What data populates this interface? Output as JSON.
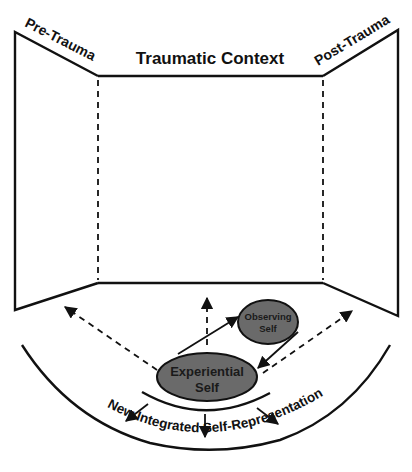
{
  "diagram": {
    "labels": {
      "pre_trauma": "Pre-Trauma",
      "traumatic_context": "Traumatic Context",
      "post_trauma": "Post-Trauma",
      "new_integrated": "New Integrated Self-Representation"
    },
    "nodes": {
      "observing_self": {
        "line1": "Observing",
        "line2": "Self"
      },
      "experiential_self": {
        "line1": "Experiential",
        "line2": "Self"
      }
    },
    "panels": [
      "Pre-Trauma",
      "Traumatic Context",
      "Post-Trauma"
    ],
    "edges": [
      {
        "from": "Experiential Self",
        "to": "Observing Self",
        "style": "solid"
      },
      {
        "from": "Observing Self",
        "to": "Experiential Self",
        "style": "solid"
      },
      {
        "from": "Experiential Self",
        "to": "Pre-Trauma",
        "style": "dashed"
      },
      {
        "from": "Experiential Self",
        "to": "Traumatic Context",
        "style": "dashed"
      },
      {
        "from": "Experiential Self",
        "to": "Post-Trauma",
        "style": "dashed"
      },
      {
        "from": "Experiential Self",
        "to": "New Integrated Self-Representation",
        "style": "solid",
        "count": 3
      }
    ],
    "colors": {
      "line": "#111111",
      "ellipse_fill": "#6a6a6a",
      "background": "#ffffff"
    }
  }
}
